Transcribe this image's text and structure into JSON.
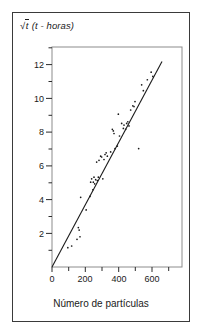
{
  "figure": {
    "background_color": "#ffffff",
    "frame_color": "#3a3a3a",
    "axis_color": "#2a2a2a",
    "point_color": "#1a1a1a",
    "line_color": "#1a1a1a"
  },
  "labels": {
    "ylabel_sqrt": "√",
    "ylabel_var": "t",
    "ylabel_paren": "(t - horas)",
    "ylabel_full": "√t (t - horas)",
    "xlabel": "Número de partículas"
  },
  "chart_data": {
    "type": "scatter",
    "title": "",
    "xlabel": "Número de partículas",
    "ylabel": "√t (t - horas)",
    "xlim": [
      0,
      780
    ],
    "ylim": [
      0,
      13.1
    ],
    "grid": false,
    "legend": null,
    "x_ticks_major": [
      0,
      200,
      400,
      600
    ],
    "x_tick_labels": [
      "0",
      "200",
      "400",
      "600"
    ],
    "x_ticks_minor": [
      100,
      300,
      500,
      700
    ],
    "y_ticks_major": [
      2,
      4,
      6,
      8,
      10,
      12
    ],
    "y_tick_labels": [
      "2",
      "4",
      "6",
      "8",
      "10",
      "12"
    ],
    "y_ticks_minor": [
      1,
      3,
      5,
      7,
      9,
      11,
      13
    ],
    "series": [
      {
        "name": "observaciones",
        "marker": "dot",
        "points": [
          [
            95,
            1.15
          ],
          [
            118,
            1.25
          ],
          [
            150,
            1.65
          ],
          [
            158,
            2.35
          ],
          [
            163,
            2.2
          ],
          [
            168,
            1.8
          ],
          [
            172,
            4.15
          ],
          [
            205,
            3.4
          ],
          [
            228,
            4.2
          ],
          [
            232,
            5.05
          ],
          [
            238,
            5.25
          ],
          [
            245,
            4.6
          ],
          [
            248,
            5.05
          ],
          [
            252,
            5.35
          ],
          [
            256,
            4.95
          ],
          [
            262,
            5.2
          ],
          [
            268,
            6.25
          ],
          [
            272,
            5.15
          ],
          [
            278,
            5.35
          ],
          [
            282,
            6.35
          ],
          [
            292,
            6.6
          ],
          [
            298,
            6.55
          ],
          [
            305,
            5.25
          ],
          [
            312,
            6.4
          ],
          [
            318,
            6.7
          ],
          [
            325,
            6.8
          ],
          [
            332,
            6.6
          ],
          [
            352,
            6.85
          ],
          [
            362,
            8.2
          ],
          [
            368,
            8.1
          ],
          [
            372,
            7.95
          ],
          [
            378,
            7.05
          ],
          [
            392,
            7.2
          ],
          [
            398,
            9.1
          ],
          [
            405,
            7.8
          ],
          [
            418,
            8.55
          ],
          [
            428,
            8.25
          ],
          [
            432,
            8.45
          ],
          [
            442,
            8.2
          ],
          [
            448,
            8.55
          ],
          [
            455,
            8.65
          ],
          [
            462,
            8.4
          ],
          [
            472,
            9.35
          ],
          [
            485,
            9.6
          ],
          [
            492,
            9.55
          ],
          [
            498,
            9.85
          ],
          [
            520,
            7.05
          ],
          [
            538,
            10.85
          ],
          [
            548,
            10.5
          ],
          [
            572,
            11.15
          ],
          [
            595,
            11.6
          ],
          [
            605,
            11.35
          ]
        ]
      }
    ],
    "fit_line": {
      "name": "recta de regresión",
      "x_start": 0,
      "y_start": 0,
      "x_end": 660,
      "y_end": 12.2,
      "slope": 0.01848,
      "intercept": 0
    }
  }
}
